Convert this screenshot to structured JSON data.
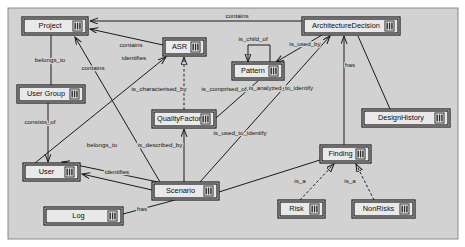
{
  "diagram": {
    "type": "class-diagram",
    "title": "",
    "canvas": {
      "x": 8,
      "y": 8,
      "width": 450,
      "height": 231,
      "background": "#d2d2d2",
      "border": "#8a8a8a"
    },
    "node_fill": "#e9e9e9",
    "node_stroke": "#1a1a1a",
    "edge_stroke": "#1a1a1a",
    "icon_name": "class-icon",
    "nodes": [
      {
        "id": "project",
        "label": "Project",
        "x": 22,
        "y": 17,
        "w": 66,
        "h": 18
      },
      {
        "id": "asr",
        "label": "ASR",
        "x": 163,
        "y": 38,
        "w": 43,
        "h": 18
      },
      {
        "id": "architecturedecision",
        "label": "ArchitectureDecision",
        "x": 302,
        "y": 17,
        "w": 98,
        "h": 18
      },
      {
        "id": "pattern",
        "label": "Pattern",
        "x": 232,
        "y": 62,
        "w": 52,
        "h": 18
      },
      {
        "id": "usergroup",
        "label": "User Group",
        "x": 17,
        "y": 85,
        "w": 68,
        "h": 18
      },
      {
        "id": "qualityfactor",
        "label": "QualityFactor",
        "x": 152,
        "y": 110,
        "w": 64,
        "h": 18
      },
      {
        "id": "designhistory",
        "label": "DesignHistory",
        "x": 362,
        "y": 109,
        "w": 88,
        "h": 18
      },
      {
        "id": "finding",
        "label": "Finding",
        "x": 320,
        "y": 145,
        "w": 51,
        "h": 18
      },
      {
        "id": "user",
        "label": "User",
        "x": 23,
        "y": 163,
        "w": 57,
        "h": 18
      },
      {
        "id": "scenario",
        "label": "Scenario",
        "x": 152,
        "y": 182,
        "w": 67,
        "h": 18
      },
      {
        "id": "risk",
        "label": "Risk",
        "x": 278,
        "y": 200,
        "w": 47,
        "h": 18
      },
      {
        "id": "nonrisks",
        "label": "NonRisks",
        "x": 352,
        "y": 200,
        "w": 63,
        "h": 18
      },
      {
        "id": "log",
        "label": "Log",
        "x": 44,
        "y": 207,
        "w": 79,
        "h": 18
      }
    ],
    "edges": [
      {
        "id": "ad-contains-project",
        "label": "contains",
        "label_x": 237,
        "label_y": 16,
        "from": "architecturedecision",
        "to": "project",
        "style": "solid",
        "arrow": "open",
        "path": "M 302 21 L 90 21"
      },
      {
        "id": "asr-contains-project",
        "label": "contains",
        "label_x": 131,
        "label_y": 45,
        "from": "asr",
        "to": "project",
        "style": "solid",
        "arrow": "open",
        "path": "M 163 45 L 90 29"
      },
      {
        "id": "usergroup-belongsto-project",
        "label": "belongs_to",
        "label_x": 50,
        "label_y": 60,
        "from": "usergroup",
        "to": "project",
        "style": "solid",
        "arrow": "none",
        "path": "M 51 85 L 51 35"
      },
      {
        "id": "scenario-contains-project",
        "label": "contains",
        "label_x": 93,
        "label_y": 68,
        "from": "scenario",
        "to": "project",
        "style": "solid",
        "arrow": "open",
        "path": "M 160 182 L 75 37"
      },
      {
        "id": "asr-ischildof-asr",
        "label": "is_child_of",
        "label_x": 253,
        "label_y": 39,
        "from": "pattern",
        "to": "pattern",
        "style": "solid",
        "arrow": "closed",
        "path": "M 270 62 L 270 45 L 248 45 L 248 62"
      },
      {
        "id": "ad-isusedby-pattern",
        "label": "is_used_by",
        "label_x": 305,
        "label_y": 44,
        "from": "architecturedecision",
        "to": "pattern",
        "style": "solid",
        "arrow": "open",
        "path": "M 322 35 L 276 62"
      },
      {
        "id": "asr-ischaracterised-qf",
        "label": "is_characterised_by",
        "label_x": 159,
        "label_y": 89,
        "from": "qualityfactor",
        "to": "asr",
        "style": "dashed",
        "arrow": "closed",
        "path": "M 184 110 L 184 57"
      },
      {
        "id": "asr-iscomprisedof",
        "label": "is_comprised_of",
        "label_x": 224,
        "label_y": 89,
        "from": "qualityfactor",
        "to": "pattern",
        "style": "solid",
        "arrow": "none",
        "path": "M 216 118 L 258 81"
      },
      {
        "id": "user-identifies-asr",
        "label": "identifies",
        "label_x": 134,
        "label_y": 58,
        "from": "user",
        "to": "asr",
        "style": "solid",
        "arrow": "open",
        "path": "M 35 163 L 166 57"
      },
      {
        "id": "usergroup-consistsof-user",
        "label": "consists_of",
        "label_x": 40,
        "label_y": 122,
        "from": "usergroup",
        "to": "user",
        "style": "solid",
        "arrow": "open",
        "path": "M 48 103 L 48 162"
      },
      {
        "id": "scenario-belongsto-user",
        "label": "belongs_to",
        "label_x": 102,
        "label_y": 145,
        "from": "scenario",
        "to": "user",
        "style": "solid",
        "arrow": "open",
        "path": "M 158 182 L 62 162"
      },
      {
        "id": "scenario-isdescribedby-qf",
        "label": "is_described_by",
        "label_x": 160,
        "label_y": 145,
        "from": "scenario",
        "to": "qualityfactor",
        "style": "solid",
        "arrow": "open",
        "path": "M 184 182 L 184 129"
      },
      {
        "id": "scenario-identifies-user",
        "label": "identifies",
        "label_x": 117,
        "label_y": 172,
        "from": "scenario",
        "to": "user",
        "style": "solid",
        "arrow": "open",
        "path": "M 152 190 L 82 174"
      },
      {
        "id": "scenario-isusedtoidentify-ad",
        "label": "is_used_to_identify",
        "label_x": 240,
        "label_y": 133,
        "from": "scenario",
        "to": "architecturedecision",
        "style": "solid",
        "arrow": "open",
        "path": "M 200 182 L 330 36"
      },
      {
        "id": "ad-isanalyzedtoidentify",
        "label": "is_analyzed_to_identify",
        "label_x": 281,
        "label_y": 88,
        "from": "finding",
        "to": "architecturedecision",
        "style": "solid",
        "arrow": "open",
        "path": "M 344 145 L 344 36"
      },
      {
        "id": "ad-has-designhistory",
        "label": "has",
        "label_x": 350,
        "label_y": 65,
        "from": "designhistory",
        "to": "architecturedecision",
        "style": "solid",
        "arrow": "none",
        "path": "M 390 109 L 358 36"
      },
      {
        "id": "scenario-finding",
        "label": "",
        "label_x": 0,
        "label_y": 0,
        "from": "scenario",
        "to": "finding",
        "style": "solid",
        "arrow": "none",
        "path": "M 219 192 L 320 160"
      },
      {
        "id": "risk-isa-finding",
        "label": "is_a",
        "label_x": 300,
        "label_y": 181,
        "from": "risk",
        "to": "finding",
        "style": "dashed",
        "arrow": "closed",
        "path": "M 300 200 L 334 164"
      },
      {
        "id": "nonrisks-isa-finding",
        "label": "is_a",
        "label_x": 350,
        "label_y": 181,
        "from": "nonrisks",
        "to": "finding",
        "style": "dashed",
        "arrow": "closed",
        "path": "M 374 200 L 356 164"
      },
      {
        "id": "log-has-scenario",
        "label": "has",
        "label_x": 142,
        "label_y": 209,
        "from": "log",
        "to": "scenario",
        "style": "solid",
        "arrow": "none",
        "path": "M 123 214 L 175 200"
      }
    ]
  }
}
